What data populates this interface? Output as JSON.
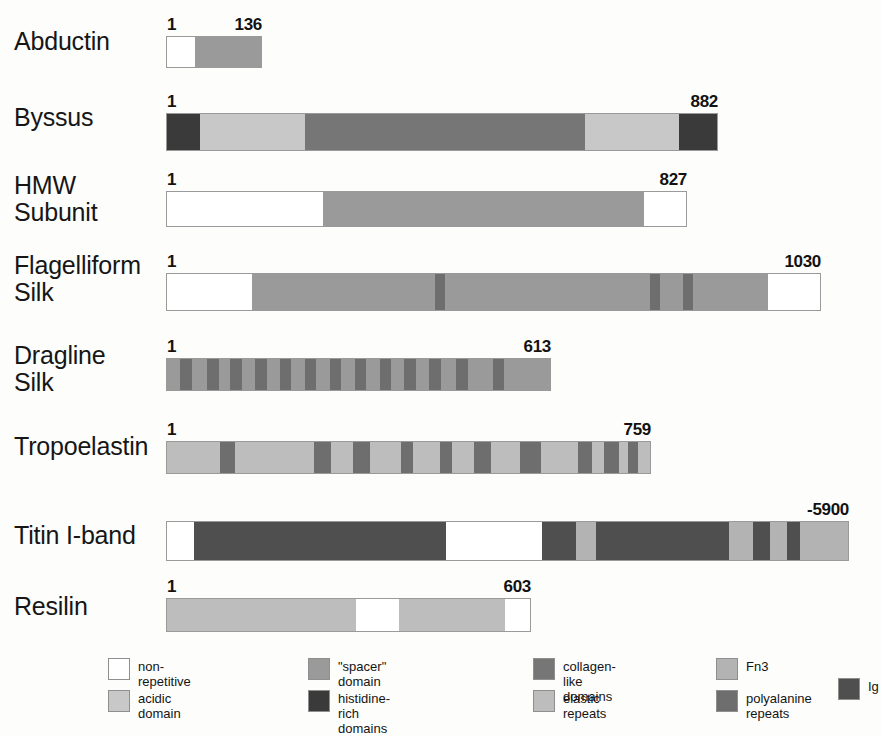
{
  "figure": {
    "type": "protein-domain-diagram"
  },
  "colors": {
    "non_repetitive": "#ffffff",
    "acidic_domain": "#c8c8c8",
    "spacer_domain": "#9a9a9a",
    "histidine_rich": "#3a3a3a",
    "collagen_like": "#767676",
    "elastic_repeats": "#bdbdbd",
    "fn3": "#b3b3b3",
    "polyalanine_repeats": "#6e6e6e",
    "ig": "#4f4f4f",
    "outline": "#9a9a9a",
    "text": "#161616",
    "background": "#fdfdfc"
  },
  "proteins": [
    {
      "name": "Abductin",
      "start_label": "1",
      "end_label": "136",
      "length": 136,
      "segments": [
        {
          "domain": "non-repetitive",
          "start": 0,
          "end": 30
        },
        {
          "domain": "spacer domain",
          "start": 30,
          "end": 100
        }
      ]
    },
    {
      "name": "Byssus",
      "start_label": "1",
      "end_label": "882",
      "length": 882,
      "segments": [
        {
          "domain": "histidine-rich domains",
          "start": 0,
          "end": 6
        },
        {
          "domain": "acidic domain",
          "start": 6,
          "end": 25
        },
        {
          "domain": "collagen-like domains",
          "start": 25,
          "end": 54
        },
        {
          "domain": "collagen-like domains",
          "start": 54,
          "end": 71
        },
        {
          "domain": "collagen-like domains",
          "start": 71,
          "end": 76
        },
        {
          "domain": "acidic domain",
          "start": 76,
          "end": 80
        },
        {
          "domain": "acidic domain",
          "start": 80,
          "end": 93
        },
        {
          "domain": "histidine-rich domains",
          "start": 93,
          "end": 100
        }
      ]
    },
    {
      "name": "HMW\nSubunit",
      "start_label": "1",
      "end_label": "827",
      "length": 827,
      "segments": [
        {
          "domain": "non-repetitive",
          "start": 0,
          "end": 30
        },
        {
          "domain": "spacer domain",
          "start": 30,
          "end": 92
        },
        {
          "domain": "non-repetitive",
          "start": 92,
          "end": 100
        }
      ]
    },
    {
      "name": "Flagelliform\nSilk",
      "start_label": "1",
      "end_label": "1030",
      "length": 1030,
      "segments": [
        {
          "domain": "non-repetitive",
          "start": 0,
          "end": 13
        },
        {
          "domain": "spacer domain",
          "start": 13,
          "end": 41
        },
        {
          "domain": "polyalanine repeats",
          "start": 41,
          "end": 42.5
        },
        {
          "domain": "spacer domain",
          "start": 42.5,
          "end": 74
        },
        {
          "domain": "polyalanine repeats",
          "start": 74,
          "end": 75.5
        },
        {
          "domain": "spacer domain",
          "start": 75.5,
          "end": 79
        },
        {
          "domain": "polyalanine repeats",
          "start": 79,
          "end": 80.5
        },
        {
          "domain": "spacer domain",
          "start": 80.5,
          "end": 92
        },
        {
          "domain": "non-repetitive",
          "start": 92,
          "end": 100
        }
      ]
    },
    {
      "name": "Dragline\nSilk",
      "start_label": "1",
      "end_label": "613",
      "length": 613,
      "segments": [
        {
          "domain": "spacer domain",
          "start": 0,
          "end": 100
        },
        {
          "domain": "polyalanine repeats",
          "start": 3.5,
          "end": 6.5
        },
        {
          "domain": "polyalanine repeats",
          "start": 10.5,
          "end": 13.5
        },
        {
          "domain": "polyalanine repeats",
          "start": 16.5,
          "end": 19.5
        },
        {
          "domain": "polyalanine repeats",
          "start": 23,
          "end": 26
        },
        {
          "domain": "polyalanine repeats",
          "start": 29.5,
          "end": 32.5
        },
        {
          "domain": "polyalanine repeats",
          "start": 36,
          "end": 39
        },
        {
          "domain": "polyalanine repeats",
          "start": 42.5,
          "end": 45.5
        },
        {
          "domain": "polyalanine repeats",
          "start": 49,
          "end": 52
        },
        {
          "domain": "polyalanine repeats",
          "start": 55.5,
          "end": 58.5
        },
        {
          "domain": "polyalanine repeats",
          "start": 62,
          "end": 65
        },
        {
          "domain": "polyalanine repeats",
          "start": 68.5,
          "end": 71.5
        },
        {
          "domain": "polyalanine repeats",
          "start": 75.5,
          "end": 78.5
        },
        {
          "domain": "polyalanine repeats",
          "start": 85,
          "end": 88
        }
      ]
    },
    {
      "name": "Tropoelastin",
      "start_label": "1",
      "end_label": "759",
      "length": 759,
      "segments": [
        {
          "domain": "elastic repeats",
          "start": 0,
          "end": 100
        },
        {
          "domain": "polyalanine repeats",
          "start": 11,
          "end": 14
        },
        {
          "domain": "polyalanine repeats",
          "start": 30.5,
          "end": 34
        },
        {
          "domain": "polyalanine repeats",
          "start": 38.5,
          "end": 42
        },
        {
          "domain": "polyalanine repeats",
          "start": 48.5,
          "end": 51
        },
        {
          "domain": "polyalanine repeats",
          "start": 56.5,
          "end": 59
        },
        {
          "domain": "polyalanine repeats",
          "start": 63.5,
          "end": 67
        },
        {
          "domain": "polyalanine repeats",
          "start": 73,
          "end": 77.5
        },
        {
          "domain": "polyalanine repeats",
          "start": 85,
          "end": 88
        },
        {
          "domain": "polyalanine repeats",
          "start": 90.5,
          "end": 93.5
        },
        {
          "domain": "polyalanine repeats",
          "start": 95.5,
          "end": 97.5
        }
      ]
    },
    {
      "name": "Titin I-band",
      "start_label": "",
      "end_label": "-5900",
      "length": 5900,
      "segments": [
        {
          "domain": "non-repetitive",
          "start": 0,
          "end": 4
        },
        {
          "domain": "Ig",
          "start": 4,
          "end": 41
        },
        {
          "domain": "non-repetitive",
          "start": 41,
          "end": 55
        },
        {
          "domain": "Ig",
          "start": 55,
          "end": 60
        },
        {
          "domain": "Fn3",
          "start": 60,
          "end": 63
        },
        {
          "domain": "Ig",
          "start": 63,
          "end": 82.5
        },
        {
          "domain": "Fn3",
          "start": 82.5,
          "end": 86
        },
        {
          "domain": "Ig",
          "start": 86,
          "end": 88.5
        },
        {
          "domain": "Fn3",
          "start": 88.5,
          "end": 91
        },
        {
          "domain": "Ig",
          "start": 91,
          "end": 93
        },
        {
          "domain": "Fn3",
          "start": 93,
          "end": 100
        }
      ]
    },
    {
      "name": "Resilin",
      "start_label": "1",
      "end_label": "603",
      "length": 603,
      "segments": [
        {
          "domain": "elastic repeats",
          "start": 0,
          "end": 52
        },
        {
          "domain": "non-repetitive",
          "start": 52,
          "end": 64
        },
        {
          "domain": "elastic repeats",
          "start": 64,
          "end": 93
        },
        {
          "domain": "non-repetitive",
          "start": 93,
          "end": 100
        }
      ]
    }
  ],
  "legend": {
    "entries": [
      {
        "label": "non-repetitive",
        "color_key": "non_repetitive"
      },
      {
        "label": "acidic domain",
        "color_key": "acidic_domain"
      },
      {
        "label": "\"spacer\" domain",
        "color_key": "spacer_domain"
      },
      {
        "label": "histidine-rich\ndomains",
        "color_key": "histidine_rich"
      },
      {
        "label": "collagen-like domains",
        "color_key": "collagen_like"
      },
      {
        "label": "elastic repeats",
        "color_key": "elastic_repeats"
      },
      {
        "label": "Fn3",
        "color_key": "fn3"
      },
      {
        "label": "polyalanine\nrepeats",
        "color_key": "polyalanine_repeats"
      },
      {
        "label": "Ig",
        "color_key": "ig"
      }
    ]
  }
}
